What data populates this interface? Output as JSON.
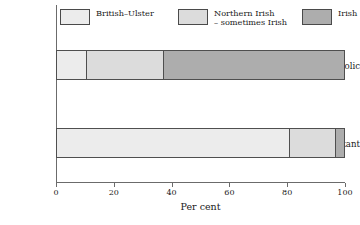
{
  "chart_data": {
    "type": "bar",
    "orientation": "horizontal",
    "stacked": true,
    "title": "",
    "subtitle": "",
    "xlabel": "Per cent",
    "ylabel": "",
    "xlim": [
      0,
      100
    ],
    "xticks": [
      0,
      20,
      40,
      60,
      80,
      100
    ],
    "xticklabels": [
      "0",
      "20",
      "40",
      "60",
      "80",
      "100"
    ],
    "grid": false,
    "legend_position": "top",
    "categories": [
      "Catholic",
      "Protestant"
    ],
    "series": [
      {
        "name": "British–Ulster",
        "fill": "fill-a",
        "color": "#ececec",
        "values": [
          10,
          81
        ]
      },
      {
        "name": "Northern Irish\n– sometimes Irish",
        "fill": "fill-b",
        "color": "#dcdcdc",
        "values": [
          27,
          16
        ]
      },
      {
        "name": "Irish",
        "fill": "fill-c",
        "color": "#adadad",
        "values": [
          63,
          3
        ]
      }
    ]
  },
  "legend": {
    "items": [
      {
        "label": "British–Ulster",
        "fill": "fill-a"
      },
      {
        "label": "Northern Irish\n– sometimes Irish",
        "fill": "fill-b"
      },
      {
        "label": "Irish",
        "fill": "fill-c"
      }
    ]
  },
  "axis": {
    "x_title": "Per cent",
    "tick_labels": [
      "0",
      "20",
      "40",
      "60",
      "80",
      "100"
    ]
  },
  "colors": {
    "axis": "#6b6b6b",
    "bar_outline": "#4f4f4f",
    "text": "#1a1a1a",
    "background": "#ffffff"
  }
}
